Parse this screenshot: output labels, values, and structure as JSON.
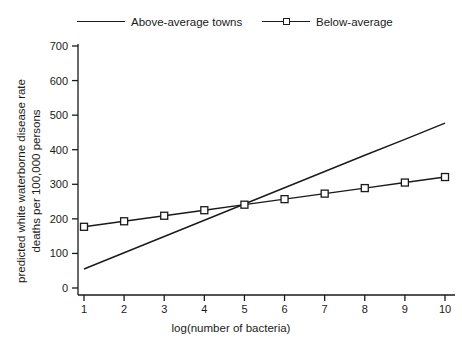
{
  "chart_data": {
    "type": "line",
    "title": "",
    "xlabel": "log(number of bacteria)",
    "ylabel_line1": "predicted white waterborne disease rate",
    "ylabel_line2": "deaths per 100,000 persons",
    "x": [
      1,
      2,
      3,
      4,
      5,
      6,
      7,
      8,
      9,
      10
    ],
    "xlim": [
      1,
      10
    ],
    "ylim": [
      0,
      700
    ],
    "xticks": [
      "1",
      "2",
      "3",
      "4",
      "5",
      "6",
      "7",
      "8",
      "9",
      "10"
    ],
    "yticks": [
      "0",
      "100",
      "200",
      "300",
      "400",
      "500",
      "600",
      "700"
    ],
    "grid": false,
    "legend_position": "top",
    "series": [
      {
        "name": "Above-average towns",
        "marker": "none",
        "color": "#1a1a1a",
        "values": [
          55,
          102,
          149,
          196,
          243,
          290,
          337,
          384,
          430,
          477
        ]
      },
      {
        "name": "Below-average",
        "marker": "square",
        "color": "#1a1a1a",
        "values": [
          177,
          193,
          209,
          225,
          241,
          257,
          273,
          289,
          305,
          321
        ]
      }
    ]
  },
  "legend": {
    "entries": [
      {
        "label": "Above-average towns"
      },
      {
        "label": "Below-average"
      }
    ]
  }
}
